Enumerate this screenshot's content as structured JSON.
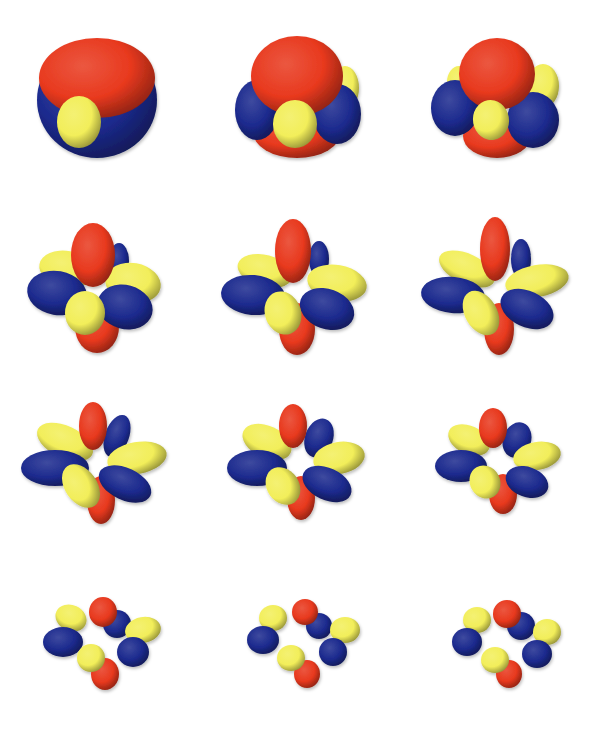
{
  "figure": {
    "rows": 4,
    "cols": 3,
    "background": "#ffffff",
    "colors": {
      "red": "#e8391e",
      "yellow": "#f2ee5a",
      "blue": "#1c2a8e"
    }
  },
  "cells": [
    {
      "name": "sphere-1",
      "cx": 97,
      "cy": 100,
      "lobes": [
        {
          "c": "blue",
          "x": 0,
          "y": 0,
          "rx": 60,
          "ry": 58,
          "rot": 0
        },
        {
          "c": "red",
          "x": 0,
          "y": -22,
          "rx": 58,
          "ry": 40,
          "rot": 0
        },
        {
          "c": "yellow",
          "x": -18,
          "y": 22,
          "rx": 22,
          "ry": 26,
          "rot": 0
        }
      ]
    },
    {
      "name": "sphere-2",
      "cx": 297,
      "cy": 100,
      "lobes": [
        {
          "c": "yellow",
          "x": 48,
          "y": -12,
          "rx": 14,
          "ry": 22,
          "rot": 0
        },
        {
          "c": "red",
          "x": 0,
          "y": 32,
          "rx": 44,
          "ry": 26,
          "rot": 0
        },
        {
          "c": "blue",
          "x": -40,
          "y": 10,
          "rx": 22,
          "ry": 30,
          "rot": 0
        },
        {
          "c": "blue",
          "x": 40,
          "y": 14,
          "rx": 24,
          "ry": 30,
          "rot": 0
        },
        {
          "c": "red",
          "x": 0,
          "y": -24,
          "rx": 46,
          "ry": 40,
          "rot": 0
        },
        {
          "c": "yellow",
          "x": -2,
          "y": 24,
          "rx": 22,
          "ry": 24,
          "rot": 0
        }
      ]
    },
    {
      "name": "sphere-3",
      "cx": 497,
      "cy": 100,
      "lobes": [
        {
          "c": "yellow",
          "x": 46,
          "y": -14,
          "rx": 16,
          "ry": 22,
          "rot": 0
        },
        {
          "c": "yellow",
          "x": -38,
          "y": -18,
          "rx": 12,
          "ry": 16,
          "rot": 0
        },
        {
          "c": "red",
          "x": 0,
          "y": 36,
          "rx": 34,
          "ry": 22,
          "rot": 0
        },
        {
          "c": "blue",
          "x": -42,
          "y": 8,
          "rx": 24,
          "ry": 28,
          "rot": 0
        },
        {
          "c": "blue",
          "x": 36,
          "y": 20,
          "rx": 26,
          "ry": 28,
          "rot": 0
        },
        {
          "c": "red",
          "x": 0,
          "y": -26,
          "rx": 38,
          "ry": 36,
          "rot": 0
        },
        {
          "c": "yellow",
          "x": -6,
          "y": 20,
          "rx": 18,
          "ry": 20,
          "rot": -10
        }
      ]
    },
    {
      "name": "lobes-1",
      "cx": 97,
      "cy": 285,
      "lobes": [
        {
          "c": "blue",
          "x": 22,
          "y": -24,
          "rx": 10,
          "ry": 18,
          "rot": 0
        },
        {
          "c": "red",
          "x": 0,
          "y": 42,
          "rx": 22,
          "ry": 26,
          "rot": 0
        },
        {
          "c": "yellow",
          "x": -30,
          "y": -16,
          "rx": 28,
          "ry": 18,
          "rot": 10
        },
        {
          "c": "yellow",
          "x": 36,
          "y": -2,
          "rx": 28,
          "ry": 20,
          "rot": 10
        },
        {
          "c": "blue",
          "x": -40,
          "y": 8,
          "rx": 30,
          "ry": 22,
          "rot": 10
        },
        {
          "c": "blue",
          "x": 28,
          "y": 22,
          "rx": 28,
          "ry": 22,
          "rot": 15
        },
        {
          "c": "red",
          "x": -4,
          "y": -30,
          "rx": 22,
          "ry": 32,
          "rot": 0
        },
        {
          "c": "yellow",
          "x": -12,
          "y": 28,
          "rx": 20,
          "ry": 22,
          "rot": 0
        }
      ]
    },
    {
      "name": "lobes-2",
      "cx": 297,
      "cy": 285,
      "lobes": [
        {
          "c": "blue",
          "x": 22,
          "y": -26,
          "rx": 10,
          "ry": 18,
          "rot": 0
        },
        {
          "c": "red",
          "x": 0,
          "y": 44,
          "rx": 18,
          "ry": 26,
          "rot": 0
        },
        {
          "c": "yellow",
          "x": -32,
          "y": -14,
          "rx": 28,
          "ry": 16,
          "rot": 15
        },
        {
          "c": "yellow",
          "x": 40,
          "y": -2,
          "rx": 30,
          "ry": 18,
          "rot": 10
        },
        {
          "c": "blue",
          "x": -44,
          "y": 10,
          "rx": 32,
          "ry": 20,
          "rot": 5
        },
        {
          "c": "blue",
          "x": 30,
          "y": 24,
          "rx": 28,
          "ry": 20,
          "rot": 20
        },
        {
          "c": "red",
          "x": -4,
          "y": -34,
          "rx": 18,
          "ry": 32,
          "rot": 0
        },
        {
          "c": "yellow",
          "x": -14,
          "y": 28,
          "rx": 18,
          "ry": 22,
          "rot": -20
        }
      ]
    },
    {
      "name": "lobes-3",
      "cx": 497,
      "cy": 285,
      "lobes": [
        {
          "c": "blue",
          "x": 24,
          "y": -26,
          "rx": 10,
          "ry": 20,
          "rot": 0
        },
        {
          "c": "red",
          "x": 2,
          "y": 44,
          "rx": 15,
          "ry": 26,
          "rot": 0
        },
        {
          "c": "yellow",
          "x": -30,
          "y": -16,
          "rx": 30,
          "ry": 15,
          "rot": 25
        },
        {
          "c": "yellow",
          "x": 40,
          "y": -4,
          "rx": 32,
          "ry": 16,
          "rot": -10
        },
        {
          "c": "blue",
          "x": -44,
          "y": 10,
          "rx": 32,
          "ry": 18,
          "rot": 5
        },
        {
          "c": "blue",
          "x": 30,
          "y": 24,
          "rx": 28,
          "ry": 18,
          "rot": 25
        },
        {
          "c": "red",
          "x": -2,
          "y": -36,
          "rx": 15,
          "ry": 32,
          "rot": 0
        },
        {
          "c": "yellow",
          "x": -16,
          "y": 28,
          "rx": 16,
          "ry": 24,
          "rot": -30
        }
      ]
    },
    {
      "name": "lobes-4",
      "cx": 97,
      "cy": 460,
      "lobes": [
        {
          "c": "blue",
          "x": 20,
          "y": -24,
          "rx": 12,
          "ry": 22,
          "rot": 20
        },
        {
          "c": "red",
          "x": 4,
          "y": 40,
          "rx": 14,
          "ry": 24,
          "rot": 0
        },
        {
          "c": "yellow",
          "x": -32,
          "y": -18,
          "rx": 30,
          "ry": 16,
          "rot": 25
        },
        {
          "c": "yellow",
          "x": 40,
          "y": -2,
          "rx": 30,
          "ry": 16,
          "rot": -10
        },
        {
          "c": "blue",
          "x": -42,
          "y": 8,
          "rx": 34,
          "ry": 18,
          "rot": 0
        },
        {
          "c": "blue",
          "x": 28,
          "y": 24,
          "rx": 28,
          "ry": 16,
          "rot": 25
        },
        {
          "c": "red",
          "x": -4,
          "y": -34,
          "rx": 14,
          "ry": 24,
          "rot": 0
        },
        {
          "c": "yellow",
          "x": -16,
          "y": 26,
          "rx": 16,
          "ry": 24,
          "rot": -35
        }
      ]
    },
    {
      "name": "lobes-5",
      "cx": 297,
      "cy": 460,
      "lobes": [
        {
          "c": "blue",
          "x": 22,
          "y": -22,
          "rx": 14,
          "ry": 20,
          "rot": 20
        },
        {
          "c": "red",
          "x": 4,
          "y": 38,
          "rx": 14,
          "ry": 22,
          "rot": 0
        },
        {
          "c": "yellow",
          "x": -30,
          "y": -18,
          "rx": 26,
          "ry": 16,
          "rot": 25
        },
        {
          "c": "yellow",
          "x": 42,
          "y": -2,
          "rx": 26,
          "ry": 16,
          "rot": -10
        },
        {
          "c": "blue",
          "x": -40,
          "y": 8,
          "rx": 30,
          "ry": 18,
          "rot": 0
        },
        {
          "c": "blue",
          "x": 30,
          "y": 24,
          "rx": 26,
          "ry": 16,
          "rot": 25
        },
        {
          "c": "red",
          "x": -4,
          "y": -34,
          "rx": 14,
          "ry": 22,
          "rot": 0
        },
        {
          "c": "yellow",
          "x": -14,
          "y": 26,
          "rx": 16,
          "ry": 20,
          "rot": -35
        }
      ]
    },
    {
      "name": "lobes-6",
      "cx": 497,
      "cy": 460,
      "lobes": [
        {
          "c": "blue",
          "x": 20,
          "y": -20,
          "rx": 14,
          "ry": 18,
          "rot": 20
        },
        {
          "c": "red",
          "x": 6,
          "y": 34,
          "rx": 14,
          "ry": 20,
          "rot": 0
        },
        {
          "c": "yellow",
          "x": -28,
          "y": -20,
          "rx": 22,
          "ry": 14,
          "rot": 25
        },
        {
          "c": "yellow",
          "x": 40,
          "y": -4,
          "rx": 24,
          "ry": 14,
          "rot": -10
        },
        {
          "c": "blue",
          "x": -36,
          "y": 6,
          "rx": 26,
          "ry": 16,
          "rot": 0
        },
        {
          "c": "blue",
          "x": 30,
          "y": 22,
          "rx": 22,
          "ry": 15,
          "rot": 20
        },
        {
          "c": "red",
          "x": -4,
          "y": -32,
          "rx": 14,
          "ry": 20,
          "rot": 0
        },
        {
          "c": "yellow",
          "x": -12,
          "y": 22,
          "rx": 15,
          "ry": 17,
          "rot": -30
        }
      ]
    },
    {
      "name": "lobes-7",
      "cx": 97,
      "cy": 640,
      "lobes": [
        {
          "c": "blue",
          "x": 20,
          "y": -16,
          "rx": 14,
          "ry": 14,
          "rot": 0
        },
        {
          "c": "red",
          "x": 8,
          "y": 34,
          "rx": 14,
          "ry": 16,
          "rot": 0
        },
        {
          "c": "yellow",
          "x": -26,
          "y": -22,
          "rx": 16,
          "ry": 13,
          "rot": 25
        },
        {
          "c": "yellow",
          "x": 46,
          "y": -10,
          "rx": 18,
          "ry": 13,
          "rot": -10
        },
        {
          "c": "blue",
          "x": -34,
          "y": 2,
          "rx": 20,
          "ry": 15,
          "rot": 0
        },
        {
          "c": "blue",
          "x": 36,
          "y": 12,
          "rx": 16,
          "ry": 15,
          "rot": 0
        },
        {
          "c": "red",
          "x": 6,
          "y": -28,
          "rx": 14,
          "ry": 15,
          "rot": 0
        },
        {
          "c": "yellow",
          "x": -6,
          "y": 18,
          "rx": 14,
          "ry": 14,
          "rot": 0
        }
      ]
    },
    {
      "name": "lobes-8",
      "cx": 297,
      "cy": 640,
      "lobes": [
        {
          "c": "blue",
          "x": 22,
          "y": -14,
          "rx": 13,
          "ry": 13,
          "rot": 0
        },
        {
          "c": "red",
          "x": 10,
          "y": 34,
          "rx": 13,
          "ry": 14,
          "rot": 0
        },
        {
          "c": "yellow",
          "x": -24,
          "y": -22,
          "rx": 14,
          "ry": 13,
          "rot": 0
        },
        {
          "c": "yellow",
          "x": 48,
          "y": -10,
          "rx": 15,
          "ry": 13,
          "rot": 0
        },
        {
          "c": "blue",
          "x": -34,
          "y": 0,
          "rx": 16,
          "ry": 14,
          "rot": 0
        },
        {
          "c": "blue",
          "x": 36,
          "y": 12,
          "rx": 14,
          "ry": 14,
          "rot": 0
        },
        {
          "c": "red",
          "x": 8,
          "y": -28,
          "rx": 13,
          "ry": 13,
          "rot": 0
        },
        {
          "c": "yellow",
          "x": -6,
          "y": 18,
          "rx": 14,
          "ry": 13,
          "rot": 0
        }
      ]
    },
    {
      "name": "lobes-9",
      "cx": 497,
      "cy": 640,
      "lobes": [
        {
          "c": "blue",
          "x": 24,
          "y": -14,
          "rx": 14,
          "ry": 14,
          "rot": 0
        },
        {
          "c": "red",
          "x": 12,
          "y": 34,
          "rx": 13,
          "ry": 14,
          "rot": 0
        },
        {
          "c": "yellow",
          "x": -20,
          "y": -20,
          "rx": 14,
          "ry": 13,
          "rot": 0
        },
        {
          "c": "yellow",
          "x": 50,
          "y": -8,
          "rx": 14,
          "ry": 13,
          "rot": 0
        },
        {
          "c": "blue",
          "x": -30,
          "y": 2,
          "rx": 15,
          "ry": 14,
          "rot": 0
        },
        {
          "c": "blue",
          "x": 40,
          "y": 14,
          "rx": 15,
          "ry": 14,
          "rot": 0
        },
        {
          "c": "red",
          "x": 10,
          "y": -26,
          "rx": 14,
          "ry": 14,
          "rot": 0
        },
        {
          "c": "yellow",
          "x": -2,
          "y": 20,
          "rx": 14,
          "ry": 13,
          "rot": 0
        }
      ]
    }
  ]
}
